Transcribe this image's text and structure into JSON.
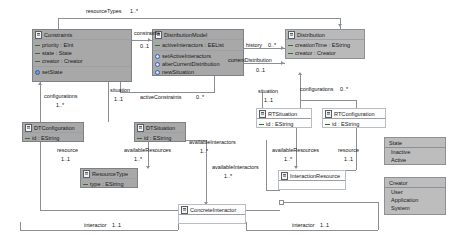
{
  "diagram": {
    "type": "uml-class-diagram",
    "background": "#ffffff",
    "line_color": "#8a8f94"
  },
  "classes": [
    {
      "id": "constraints",
      "name": "Constraints",
      "icon": "class-icon",
      "attributes": [
        {
          "icon": "attribute-icon",
          "text": "priority : EInt"
        },
        {
          "icon": "attribute-icon",
          "text": "state : State"
        },
        {
          "icon": "attribute-icon",
          "text": "creator : Creator"
        }
      ],
      "operations": [
        {
          "icon": "operation-icon",
          "text": "setState"
        }
      ]
    },
    {
      "id": "distributionModel",
      "name": "DistributionModel",
      "icon": "class-icon",
      "attributes": [
        {
          "icon": "attribute-icon",
          "text": "activeInteractors : EEList"
        }
      ],
      "operations": [
        {
          "icon": "operation-icon",
          "text": "setActiveInteractors"
        },
        {
          "icon": "operation-icon",
          "text": "alterCurrentDistribution"
        },
        {
          "icon": "operation-icon",
          "text": "newSituation"
        }
      ]
    },
    {
      "id": "distribution",
      "name": "Distribution",
      "icon": "class-icon",
      "attributes": [
        {
          "icon": "attribute-icon",
          "text": "creationTime : EString"
        },
        {
          "icon": "attribute-icon",
          "text": "creator : Creator"
        }
      ],
      "operations": []
    },
    {
      "id": "dtConfiguration",
      "name": "DTConfiguration",
      "icon": "class-icon",
      "attributes": [
        {
          "icon": "attribute-icon",
          "text": "id : EString"
        }
      ],
      "operations": []
    },
    {
      "id": "dtSituation",
      "name": "DTSituation",
      "icon": "class-icon",
      "attributes": [
        {
          "icon": "attribute-icon",
          "text": "id : EString"
        }
      ],
      "operations": []
    },
    {
      "id": "rtSituation",
      "name": "RTSituation",
      "icon": "class-icon",
      "attributes": [
        {
          "icon": "attribute-icon",
          "text": "id : EString"
        }
      ],
      "operations": []
    },
    {
      "id": "rtConfiguration",
      "name": "RTConfiguration",
      "icon": "class-icon",
      "attributes": [
        {
          "icon": "attribute-icon",
          "text": "id : EString"
        }
      ],
      "operations": []
    },
    {
      "id": "resourceType",
      "name": "ResourceType",
      "icon": "class-icon",
      "attributes": [
        {
          "icon": "attribute-icon",
          "text": "type : EString"
        }
      ],
      "operations": []
    },
    {
      "id": "interactionResource",
      "name": "InteractionResource",
      "icon": "class-icon",
      "attributes": [],
      "operations": []
    },
    {
      "id": "concreteInteractor",
      "name": "ConcreteInteractor",
      "icon": "class-icon",
      "attributes": [],
      "operations": []
    }
  ],
  "enumerations": [
    {
      "id": "state",
      "name": "State",
      "literals": [
        "Inactive",
        "Active"
      ]
    },
    {
      "id": "creator",
      "name": "Creator",
      "literals": [
        "User",
        "Application",
        "System"
      ]
    }
  ],
  "associations": [
    {
      "id": "resourceTypes",
      "role": "resourceTypes",
      "multiplicity": "1..*"
    },
    {
      "id": "constraintsRole",
      "role": "constraints",
      "multiplicity": "0..1"
    },
    {
      "id": "history",
      "role": "history",
      "multiplicity": "0..*"
    },
    {
      "id": "currentDistribution",
      "role": "currentDistribution",
      "multiplicity": "0..1"
    },
    {
      "id": "configurationsLeft",
      "role": "configurations",
      "multiplicity": "1..*"
    },
    {
      "id": "configurationsRight",
      "role": "configurations",
      "multiplicity": "0..*"
    },
    {
      "id": "situationLeft",
      "role": "situation",
      "multiplicity": "1..1"
    },
    {
      "id": "situationRight",
      "role": "situation",
      "multiplicity": "1..1"
    },
    {
      "id": "activeConstraints",
      "role": "activeConstraints",
      "multiplicity": "0..*"
    },
    {
      "id": "resourceLeft",
      "role": "resource",
      "multiplicity": "1..1"
    },
    {
      "id": "resourceRight",
      "role": "resource",
      "multiplicity": "1..1"
    },
    {
      "id": "availableResourcesL",
      "role": "availableResources",
      "multiplicity": "1..*"
    },
    {
      "id": "availableResourcesR",
      "role": "availableResources",
      "multiplicity": "1..*"
    },
    {
      "id": "availableInteractorsA",
      "role": "availableInteractors",
      "multiplicity": "1..*"
    },
    {
      "id": "availableInteractorsB",
      "role": "availableInteractors",
      "multiplicity": "1..*"
    },
    {
      "id": "interactorLeft",
      "role": "interactor",
      "multiplicity": "1..1"
    },
    {
      "id": "interactorRight",
      "role": "interactor",
      "multiplicity": "1..1"
    }
  ]
}
